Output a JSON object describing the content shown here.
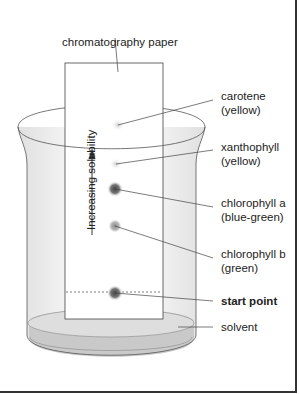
{
  "figure": {
    "paper_label": "chromatography paper",
    "arrow_label": "Increasing solubility",
    "pigments": [
      {
        "name": "carotene",
        "color_note": "(yellow)"
      },
      {
        "name": "xanthophyll",
        "color_note": "(yellow)"
      },
      {
        "name": "chlorophyll a",
        "color_note": "(blue-green)"
      },
      {
        "name": "chlorophyll b",
        "color_note": "(green)"
      }
    ],
    "start_label": "start point",
    "solvent_label": "solvent"
  },
  "colors": {
    "line": "#333333",
    "beaker_fill": "#ededed",
    "solvent": "#c8c8c8",
    "spot_dark": "#555555",
    "spot_light": "#cfcfcf"
  }
}
